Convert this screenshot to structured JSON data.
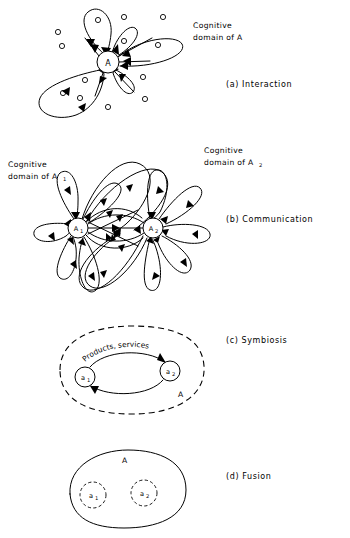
{
  "figure": {
    "background_color": "#ffffff",
    "line_color": "#000000"
  },
  "panels": [
    {
      "id": "a",
      "caption": "(a) Interaction",
      "caption_pos": {
        "x": 226,
        "y": 87
      },
      "labels": [
        {
          "name": "cognitive-domain-label",
          "line1": "Cognitive",
          "line2": "domain of A",
          "x": 193,
          "y": 28
        }
      ],
      "nodes": [
        {
          "name": "node-A",
          "label": "A",
          "sub": "",
          "cx": 108,
          "cy": 62,
          "r": 11
        }
      ],
      "lobes": [
        {
          "angle": -88,
          "length": 50,
          "width": 19,
          "arrow_in": true
        },
        {
          "angle": -55,
          "length": 32,
          "width": 13,
          "arrow_in": true
        },
        {
          "angle": -12,
          "length": 62,
          "width": 17,
          "arrow_in": true
        },
        {
          "angle": 40,
          "length": 26,
          "width": 12,
          "arrow_in": true
        },
        {
          "angle": 152,
          "length": 62,
          "width": 26,
          "arrow_in": true
        }
      ],
      "spokes": [
        {
          "angle": -30,
          "length": 30,
          "arrow_in": true
        },
        {
          "angle": 12,
          "length": 26,
          "arrow_in": true
        },
        {
          "angle": 70,
          "length": 24,
          "arrow_in": true
        },
        {
          "angle": 118,
          "length": 22,
          "arrow_in": true
        },
        {
          "angle": -120,
          "length": 22,
          "arrow_in": true
        }
      ],
      "dots": [
        {
          "cx": 98,
          "cy": 20
        },
        {
          "cx": 124,
          "cy": 17
        },
        {
          "cx": 163,
          "cy": 17
        },
        {
          "cx": 58,
          "cy": 32
        },
        {
          "cx": 62,
          "cy": 46
        },
        {
          "cx": 124,
          "cy": 41
        },
        {
          "cx": 158,
          "cy": 45
        },
        {
          "cx": 143,
          "cy": 77
        },
        {
          "cx": 145,
          "cy": 99
        },
        {
          "cx": 85,
          "cy": 80
        },
        {
          "cx": 63,
          "cy": 93
        },
        {
          "cx": 80,
          "cy": 98
        },
        {
          "cx": 108,
          "cy": 107
        }
      ]
    },
    {
      "id": "b",
      "caption": "(b) Communication",
      "caption_pos": {
        "x": 226,
        "y": 222
      },
      "labels": [
        {
          "name": "cognitive-domain-a1-label",
          "line1": "Cognitive",
          "line2": "domain of A",
          "sub": "1",
          "x": 8,
          "y": 167
        },
        {
          "name": "cognitive-domain-a2-label",
          "line1": "Cognitive",
          "line2": "domain of A",
          "sub": "2",
          "x": 204,
          "y": 153
        }
      ],
      "nodes": [
        {
          "name": "node-A1",
          "label": "A",
          "sub": "1",
          "cx": 78,
          "cy": 228,
          "r": 10
        },
        {
          "name": "node-A2",
          "label": "A",
          "sub": "2",
          "cx": 153,
          "cy": 228,
          "r": 10
        }
      ]
    },
    {
      "id": "c",
      "caption": "(c) Symbiosis",
      "caption_pos": {
        "x": 226,
        "y": 343
      },
      "boundary_label": {
        "name": "boundary-label-A",
        "text": "A",
        "x": 178,
        "y": 397
      },
      "arc_label": {
        "name": "products-services-label",
        "text": "Products, services"
      },
      "nodes": [
        {
          "name": "node-a1",
          "label": "a",
          "sub": "1",
          "cx": 85,
          "cy": 377,
          "r": 10
        },
        {
          "name": "node-a2",
          "label": "a",
          "sub": "2",
          "cx": 170,
          "cy": 371,
          "r": 10
        }
      ]
    },
    {
      "id": "d",
      "caption": "(d) Fusion",
      "caption_pos": {
        "x": 226,
        "y": 479
      },
      "boundary_label": {
        "name": "fusion-label-A",
        "text": "A",
        "x": 122,
        "y": 463
      },
      "nodes": [
        {
          "name": "node-a1-fusion",
          "label": "a",
          "sub": "1",
          "cx": 93,
          "cy": 495,
          "r": 13
        },
        {
          "name": "node-a2-fusion",
          "label": "a",
          "sub": "2",
          "cx": 144,
          "cy": 493,
          "r": 13
        }
      ]
    }
  ]
}
